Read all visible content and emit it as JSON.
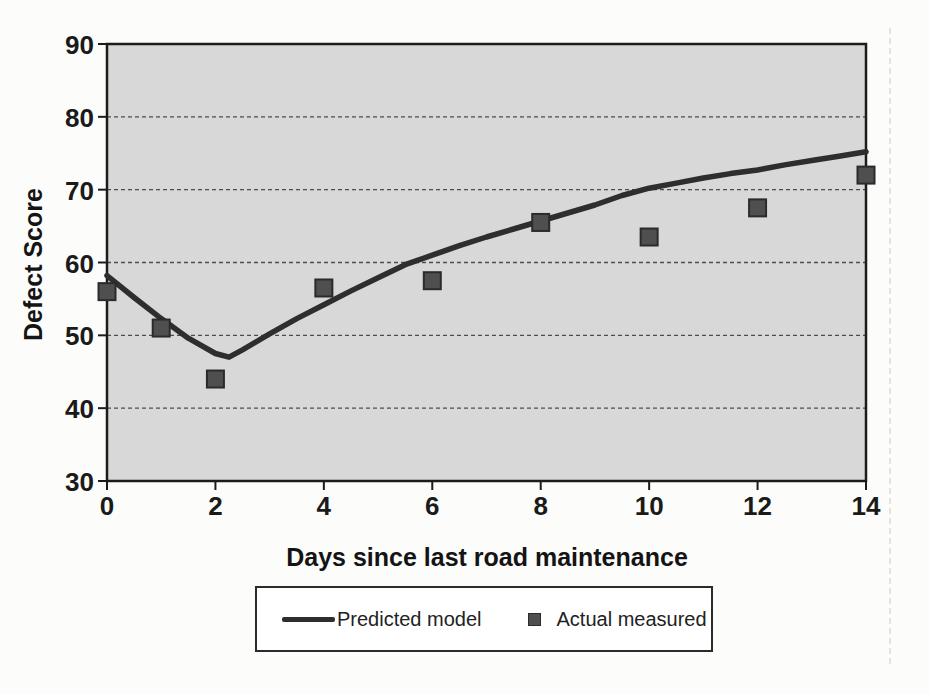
{
  "chart_data": {
    "type": "line",
    "title": "",
    "xlabel": "Days since last road maintenance",
    "ylabel": "Defect Score",
    "xlim": [
      0,
      14
    ],
    "ylim": [
      30,
      90
    ],
    "x_ticks": [
      "0",
      "2",
      "4",
      "6",
      "8",
      "10",
      "12",
      "14"
    ],
    "y_ticks": [
      "30",
      "40",
      "50",
      "60",
      "70",
      "80",
      "90"
    ],
    "grid": {
      "horizontal": true,
      "vertical": false,
      "style": "dashed",
      "color": "#4d4d4d"
    },
    "plot_area_color": "#d8d8d8",
    "axis_color": "#1c1c1c",
    "legend_position": "bottom",
    "series": [
      {
        "name": "Predicted model",
        "type": "line",
        "color": "#2e2e2e",
        "x": [
          0,
          0.5,
          1,
          1.5,
          2,
          2.25,
          2.5,
          3,
          3.5,
          4,
          4.5,
          5,
          5.5,
          6,
          6.5,
          7,
          7.5,
          8,
          8.5,
          9,
          9.5,
          10,
          10.5,
          11,
          11.5,
          12,
          12.5,
          13,
          13.5,
          14
        ],
        "y": [
          58.2,
          55.2,
          52.3,
          49.6,
          47.5,
          47.0,
          48.0,
          50.2,
          52.3,
          54.2,
          56.1,
          57.9,
          59.7,
          61.0,
          62.3,
          63.5,
          64.6,
          65.7,
          66.8,
          67.9,
          69.2,
          70.2,
          70.9,
          71.6,
          72.2,
          72.7,
          73.4,
          74.0,
          74.6,
          75.2
        ]
      },
      {
        "name": "Actual measured",
        "type": "scatter",
        "marker": "square",
        "color": "#4f4f4f",
        "marker_border": "#2b2b2b",
        "x": [
          0,
          1,
          2,
          4,
          6,
          8,
          10,
          12,
          14
        ],
        "y": [
          56,
          51,
          44,
          56.5,
          57.5,
          65.5,
          63.5,
          67.5,
          72
        ]
      }
    ]
  }
}
